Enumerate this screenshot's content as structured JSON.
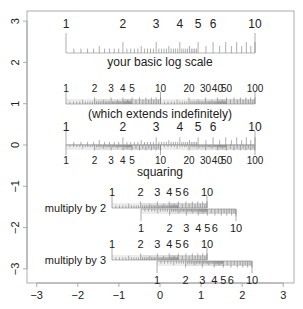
{
  "chart_data": {
    "type": "diagram",
    "title": "",
    "xlabel": "",
    "ylabel": "",
    "xlim": [
      -3.2,
      3.2
    ],
    "ylim": [
      -3.3,
      3.25
    ],
    "x_ticks": [
      -3,
      -2,
      -1,
      0,
      1,
      2,
      3
    ],
    "y_ticks": [
      3,
      2,
      1,
      0,
      -1,
      -2,
      -3
    ],
    "grid": false,
    "scales": [
      {
        "id": "basic",
        "caption": "your basic log scale",
        "labels": [
          "1",
          "2",
          "3",
          "4",
          "5",
          "6",
          "10"
        ],
        "label_values": [
          1,
          2,
          3,
          4,
          5,
          6,
          10
        ],
        "decades": 1,
        "x_start_px": 66,
        "x_end_px": 255,
        "baseline_px": 53
      },
      {
        "id": "extends",
        "caption": "(which extends indefinitely)",
        "labels": [
          "1",
          "2",
          "3",
          "4",
          "5",
          "10",
          "20",
          "30",
          "40",
          "50",
          "100"
        ],
        "label_values": [
          1,
          2,
          3,
          4,
          5,
          10,
          20,
          30,
          40,
          50,
          100
        ],
        "decades": 2,
        "x_start_px": 66,
        "x_end_px": 255,
        "baseline_px": 104
      },
      {
        "id": "squaring",
        "caption": "squaring",
        "top_labels": [
          "1",
          "2",
          "3",
          "4",
          "5",
          "6",
          "10"
        ],
        "top_values": [
          1,
          2,
          3,
          4,
          5,
          6,
          10
        ],
        "bottom_labels": [
          "1",
          "2",
          "3",
          "4",
          "5",
          "10",
          "20",
          "30",
          "40",
          "50",
          "100"
        ],
        "bottom_values": [
          1,
          2,
          3,
          4,
          5,
          10,
          20,
          30,
          40,
          50,
          100
        ],
        "x_start_px": 66,
        "x_end_px": 255,
        "baseline_px": 145
      },
      {
        "id": "multiply2",
        "caption": "multiply by 2",
        "multiplier": 2,
        "top_labels": [
          "1",
          "2",
          "3",
          "4",
          "5",
          "6",
          "10"
        ],
        "bottom_labels": [
          "1",
          "2",
          "3",
          "4",
          "5",
          "6",
          "10"
        ],
        "top_x_start_px": 112,
        "top_x_end_px": 207,
        "bottom_x_start_px": 141,
        "bottom_x_end_px": 236,
        "baseline_px": 208
      },
      {
        "id": "multiply3",
        "caption": "multiply by 3",
        "multiplier": 3,
        "top_labels": [
          "1",
          "2",
          "3",
          "4",
          "5",
          "6",
          "10"
        ],
        "bottom_labels": [
          "1",
          "2",
          "3",
          "4",
          "5",
          "6",
          "10"
        ],
        "top_x_start_px": 112,
        "top_x_end_px": 207,
        "bottom_x_start_px": 157,
        "bottom_x_end_px": 252,
        "baseline_px": 260
      }
    ]
  }
}
